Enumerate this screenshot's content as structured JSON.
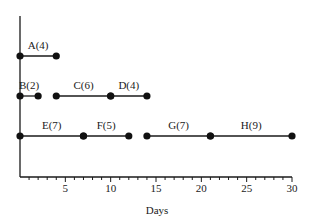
{
  "diagram": {
    "type": "activity-network-timeline",
    "x_axis": {
      "label": "Days",
      "min": 0,
      "max": 30,
      "major_ticks": [
        5,
        10,
        15,
        20,
        25,
        30
      ],
      "major_tick_labels": [
        "5",
        "10",
        "15",
        "20",
        "25",
        "30"
      ],
      "minor_step": 1
    },
    "rows": [
      {
        "activities": [
          {
            "label": "A(4)",
            "name": "A",
            "duration": 4,
            "start": 0,
            "end": 4
          }
        ]
      },
      {
        "activities": [
          {
            "label": "B(2)",
            "name": "B",
            "duration": 2,
            "start": 0,
            "end": 2
          },
          {
            "label": "C(6)",
            "name": "C",
            "duration": 6,
            "start": 4,
            "end": 10
          },
          {
            "label": "D(4)",
            "name": "D",
            "duration": 4,
            "start": 10,
            "end": 14
          }
        ]
      },
      {
        "activities": [
          {
            "label": "E(7)",
            "name": "E",
            "duration": 7,
            "start": 0,
            "end": 7
          },
          {
            "label": "F(5)",
            "name": "F",
            "duration": 5,
            "start": 7,
            "end": 12
          },
          {
            "label": "G(7)",
            "name": "G",
            "duration": 7,
            "start": 14,
            "end": 21
          },
          {
            "label": "H(9)",
            "name": "H",
            "duration": 9,
            "start": 21,
            "end": 30
          }
        ]
      }
    ],
    "colors": {
      "line": "#1a1a1a",
      "node": "#111111",
      "background": "#ffffff"
    }
  }
}
